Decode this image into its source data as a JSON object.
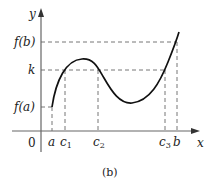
{
  "figure": {
    "caption": "(b)",
    "axes": {
      "x_label": "x",
      "y_label": "y",
      "origin_label": "0"
    },
    "y_labels": {
      "fb": "f(b)",
      "k": "k",
      "fa": "f(a)"
    },
    "x_labels": {
      "a": "a",
      "c1_base": "c",
      "c1_sub": "1",
      "c2_base": "c",
      "c2_sub": "2",
      "c3_base": "c",
      "c3_sub": "3",
      "b": "b"
    },
    "colors": {
      "curve": "#111111",
      "axis": "#666666",
      "dashed": "#777777"
    }
  }
}
